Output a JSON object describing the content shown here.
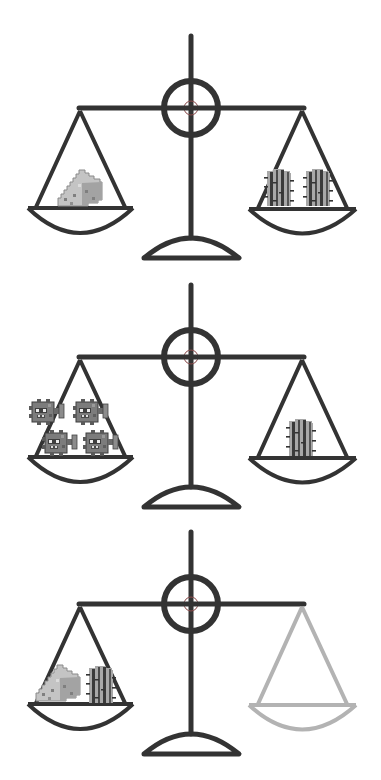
{
  "puzzle": {
    "type": "balance-scale-puzzle",
    "colors": {
      "frame": "#333333",
      "frame_faded": "#b3b3b3",
      "background": "#ffffff",
      "cheese_light": "#c9c9c9",
      "cheese_mid": "#a8a8a8",
      "cheese_dark": "#808080",
      "cactus_body": "#a9a9a9",
      "cactus_stripe": "#3a3a3a",
      "puffer_body": "#7a7a7a",
      "puffer_dark": "#3f3f3f"
    },
    "scales": [
      {
        "id": "scale-1",
        "state": "balanced",
        "left_pan": {
          "items": [
            {
              "type": "cheese",
              "count": 1
            }
          ]
        },
        "right_pan": {
          "items": [
            {
              "type": "cactus",
              "count": 2
            }
          ]
        },
        "right_faded": false
      },
      {
        "id": "scale-2",
        "state": "balanced",
        "left_pan": {
          "items": [
            {
              "type": "pufferfish",
              "count": 4
            }
          ]
        },
        "right_pan": {
          "items": [
            {
              "type": "cactus",
              "count": 1
            }
          ]
        },
        "right_faded": false
      },
      {
        "id": "scale-3",
        "state": "unknown",
        "left_pan": {
          "items": [
            {
              "type": "cheese",
              "count": 1
            },
            {
              "type": "cactus",
              "count": 1
            }
          ]
        },
        "right_pan": {
          "items": []
        },
        "right_faded": true
      }
    ]
  }
}
